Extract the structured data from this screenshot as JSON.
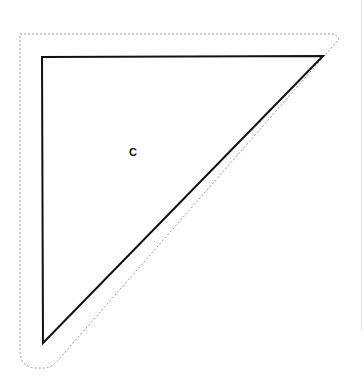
{
  "diagram": {
    "shape": {
      "type": "right-triangle",
      "label": "C",
      "vertices": [
        [
          42,
          57
        ],
        [
          323,
          56
        ],
        [
          43,
          343
        ]
      ],
      "stroke_color": "#111111"
    },
    "cut_outline": {
      "style": "dotted",
      "color": "#9a9a9a"
    },
    "colors": {
      "background": "#ffffff",
      "edge_rule": "#e2e2e2"
    }
  }
}
